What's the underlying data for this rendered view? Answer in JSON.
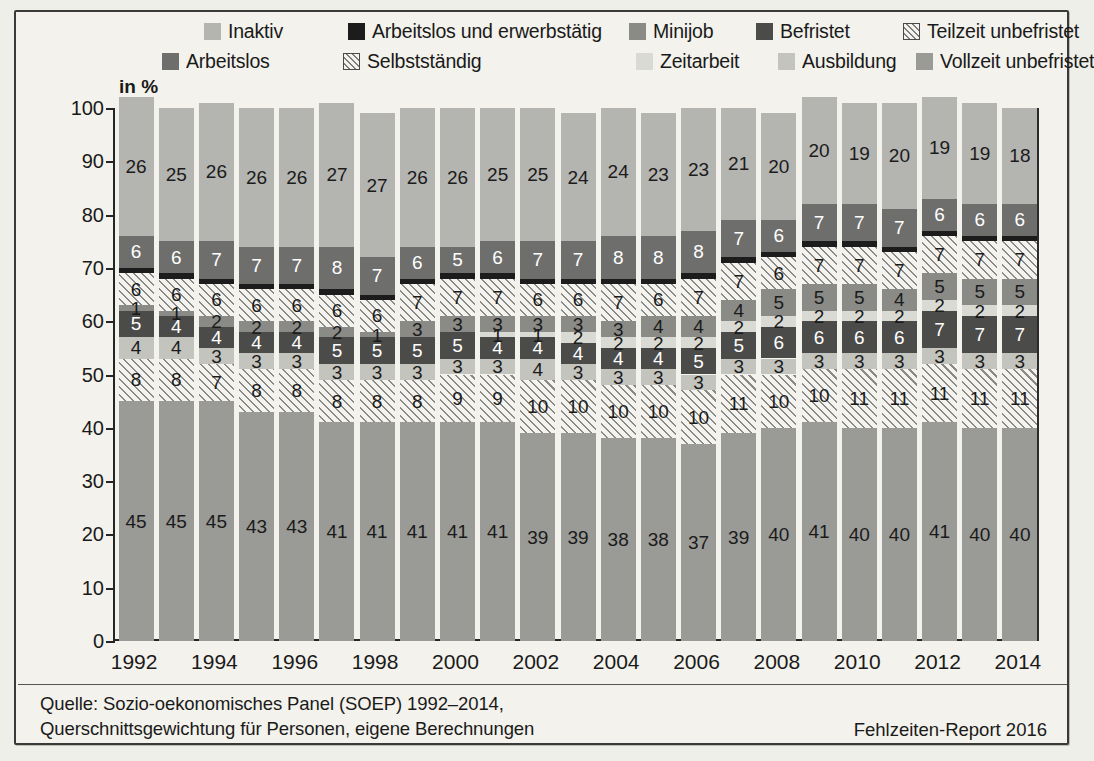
{
  "axis_label": "in %",
  "legend": {
    "row1": [
      {
        "label": "Inaktiv",
        "key": "inaktiv",
        "swatch": "inaktiv-swatch"
      },
      {
        "label": "Arbeitslos und erwerbstätig",
        "key": "alew",
        "swatch": "arbeitslos-erwerbstaetig-swatch"
      },
      {
        "label": "Minijob",
        "key": "minijob",
        "swatch": "minijob-swatch"
      },
      {
        "label": "Befristet",
        "key": "befristet",
        "swatch": "befristet-swatch"
      },
      {
        "label": "Teilzeit unbefristet",
        "key": "teilzeit",
        "swatch": "teilzeit-unbefristet-swatch"
      }
    ],
    "row2": [
      {
        "label": "Arbeitslos",
        "key": "arbeitslos",
        "swatch": "arbeitslos-swatch"
      },
      {
        "label": "Selbstständig",
        "key": "selbst",
        "swatch": "selbststaendig-swatch"
      },
      {
        "label": "Zeitarbeit",
        "key": "zeitarbeit",
        "swatch": "zeitarbeit-swatch"
      },
      {
        "label": "Ausbildung",
        "key": "ausbildung",
        "swatch": "ausbildung-swatch"
      },
      {
        "label": "Vollzeit unbefristet",
        "key": "vollzeit",
        "swatch": "vollzeit-unbefristet-swatch"
      }
    ]
  },
  "source": {
    "line1": "Quelle: Sozio-oekonomisches Panel (SOEP) 1992–2014,",
    "line2": "Querschnittsgewichtung für Personen, eigene Berechnungen"
  },
  "report": "Fehlzeiten-Report 2016",
  "colors": {
    "inaktiv": "#b4b4b0",
    "arbeitslos": "#6e6e6c",
    "alew": "#1c1c1c",
    "teilzeit": "#f4f3ef",
    "minijob": "#8a8a87",
    "zeitarbeit": "#dadad5",
    "befristet": "#4b4b4a",
    "ausbildung": "#c4c4bf",
    "selbst": "#f4f3ef",
    "vollzeit": "#9a9a96",
    "axis": "#252525",
    "background": "#f3f2ec"
  },
  "chart_data": {
    "type": "bar",
    "stacked": true,
    "title": "",
    "xlabel": "",
    "ylabel": "in %",
    "ylim": [
      0,
      100
    ],
    "yticks": [
      0,
      10,
      20,
      30,
      40,
      50,
      60,
      70,
      80,
      90,
      100
    ],
    "grid": false,
    "legend_position": "top",
    "categories": [
      "1992",
      "1993",
      "1994",
      "1995",
      "1996",
      "1997",
      "1998",
      "1999",
      "2000",
      "2001",
      "2002",
      "2003",
      "2004",
      "2005",
      "2006",
      "2007",
      "2008",
      "2009",
      "2010",
      "2011",
      "2012",
      "2013",
      "2014"
    ],
    "xtick_labels": [
      "1992",
      "1994",
      "1996",
      "1998",
      "2000",
      "2002",
      "2004",
      "2006",
      "2008",
      "2010",
      "2012",
      "2014"
    ],
    "stack_order_bottom_to_top": [
      "vollzeit",
      "selbst",
      "ausbildung",
      "befristet",
      "zeitarbeit",
      "minijob",
      "teilzeit",
      "alew",
      "arbeitslos",
      "inaktiv"
    ],
    "series": [
      {
        "name": "Vollzeit unbefristet",
        "key": "vollzeit",
        "values": [
          45,
          45,
          45,
          43,
          43,
          41,
          41,
          41,
          41,
          41,
          39,
          39,
          38,
          38,
          37,
          39,
          40,
          41,
          40,
          40,
          41,
          40,
          40
        ]
      },
      {
        "name": "Selbstständig",
        "key": "selbst",
        "values": [
          8,
          8,
          7,
          8,
          8,
          8,
          8,
          8,
          9,
          9,
          10,
          10,
          10,
          10,
          10,
          11,
          10,
          10,
          11,
          11,
          11,
          11,
          11
        ]
      },
      {
        "name": "Ausbildung",
        "key": "ausbildung",
        "values": [
          4,
          4,
          3,
          3,
          3,
          3,
          3,
          3,
          3,
          3,
          4,
          3,
          3,
          3,
          3,
          3,
          3,
          3,
          3,
          3,
          3,
          3,
          3
        ]
      },
      {
        "name": "Befristet",
        "key": "befristet",
        "values": [
          5,
          4,
          4,
          4,
          4,
          5,
          5,
          5,
          5,
          4,
          4,
          4,
          4,
          4,
          5,
          5,
          6,
          6,
          6,
          6,
          7,
          7,
          7
        ]
      },
      {
        "name": "Zeitarbeit",
        "key": "zeitarbeit",
        "values": [
          0,
          0,
          0,
          0,
          0,
          0,
          0,
          0,
          0,
          1,
          1,
          2,
          2,
          2,
          2,
          2,
          2,
          2,
          2,
          2,
          2,
          2,
          2
        ]
      },
      {
        "name": "Minijob",
        "key": "minijob",
        "values": [
          1,
          1,
          2,
          2,
          2,
          2,
          1,
          3,
          3,
          3,
          3,
          3,
          3,
          4,
          4,
          4,
          5,
          5,
          5,
          4,
          5,
          5,
          5
        ]
      },
      {
        "name": "Teilzeit unbefristet",
        "key": "teilzeit",
        "values": [
          6,
          6,
          6,
          6,
          6,
          6,
          6,
          7,
          7,
          7,
          6,
          6,
          7,
          6,
          7,
          7,
          6,
          7,
          7,
          7,
          7,
          7,
          7
        ]
      },
      {
        "name": "Arbeitslos und erwerbstätig",
        "key": "alew",
        "values": [
          1,
          1,
          1,
          1,
          1,
          1,
          1,
          1,
          1,
          1,
          1,
          1,
          1,
          1,
          1,
          1,
          1,
          1,
          1,
          1,
          1,
          1,
          1
        ]
      },
      {
        "name": "Arbeitslos",
        "key": "arbeitslos",
        "values": [
          6,
          6,
          7,
          7,
          7,
          8,
          7,
          6,
          5,
          6,
          7,
          7,
          8,
          8,
          8,
          7,
          6,
          7,
          7,
          7,
          6,
          6,
          6
        ]
      },
      {
        "name": "Inaktiv",
        "key": "inaktiv",
        "values": [
          26,
          25,
          26,
          26,
          26,
          27,
          27,
          26,
          26,
          25,
          25,
          24,
          24,
          23,
          23,
          21,
          20,
          20,
          19,
          20,
          19,
          19,
          18
        ]
      }
    ],
    "hidden_labels": [
      "alew",
      "zeitarbeit_zero"
    ]
  }
}
